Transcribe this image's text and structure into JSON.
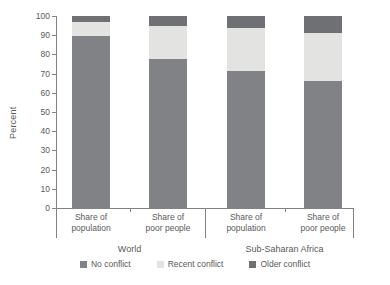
{
  "chart_data": {
    "type": "bar",
    "stacked": true,
    "title": "",
    "xlabel": "",
    "ylabel": "Percent",
    "ylim": [
      0,
      100
    ],
    "yticks": [
      0,
      10,
      20,
      30,
      40,
      50,
      60,
      70,
      80,
      90,
      100
    ],
    "ytick_labels": [
      "0",
      "10",
      "20",
      "30",
      "40",
      "50",
      "60",
      "70",
      "80",
      "90",
      "100"
    ],
    "grid": false,
    "legend_position": "bottom",
    "categories": [
      "Share of population",
      "Share of poor people",
      "Share of population",
      "Share of poor people"
    ],
    "groups": [
      {
        "label": "World",
        "categories": [
          "Share of population",
          "Share of poor people"
        ]
      },
      {
        "label": "Sub-Saharan Africa",
        "categories": [
          "Share of population",
          "Share of poor people"
        ]
      }
    ],
    "series": [
      {
        "name": "No conflict",
        "color": "#808285",
        "values": [
          89.5,
          77.5,
          71.5,
          66.0
        ]
      },
      {
        "name": "Recent conflict",
        "color": "#e3e3e1",
        "values": [
          7.5,
          17.5,
          22.5,
          25.0
        ]
      },
      {
        "name": "Older conflict",
        "color": "#6e7073",
        "values": [
          3.0,
          5.0,
          6.0,
          9.0
        ]
      }
    ]
  },
  "legend": {
    "items": [
      {
        "label": "No conflict",
        "color": "#808285"
      },
      {
        "label": "Recent conflict",
        "color": "#e3e3e1"
      },
      {
        "label": "Older conflict",
        "color": "#6e7073"
      }
    ]
  },
  "axis": {
    "y_title": "Percent"
  }
}
